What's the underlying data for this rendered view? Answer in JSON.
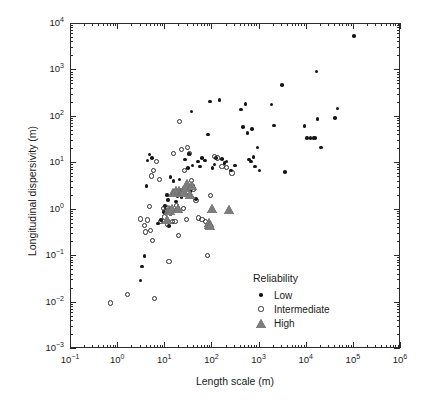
{
  "chart_data": {
    "type": "scatter",
    "title": "",
    "xlabel": "Length scale (m)",
    "ylabel": "Longitudinal dispersivity (m)",
    "xscale": "log",
    "yscale": "log",
    "xlim": [
      0.1,
      1000000
    ],
    "ylim": [
      0.001,
      10000
    ],
    "grid": false,
    "xticks": [
      0.1,
      1,
      10,
      100,
      1000,
      10000,
      100000,
      1000000
    ],
    "xtick_labels": [
      "10-1",
      "100",
      "101",
      "102",
      "103",
      "104",
      "105",
      "106"
    ],
    "yticks": [
      0.001,
      0.01,
      0.1,
      1,
      10,
      100,
      1000,
      10000
    ],
    "ytick_labels": [
      "10-3",
      "10-2",
      "10-1",
      "100",
      "101",
      "102",
      "103",
      "104"
    ],
    "legend": {
      "title": "Reliability",
      "position": "lower-right",
      "entries": [
        {
          "name": "Low",
          "marker": "filled-circle",
          "color": "#151515"
        },
        {
          "name": "Intermediate",
          "marker": "open-circle",
          "color": "#2b2b2b"
        },
        {
          "name": "High",
          "marker": "filled-triangle",
          "color": "#7d7d7d"
        }
      ]
    },
    "series": [
      {
        "name": "Low",
        "marker": "filled-circle",
        "color": "#151515",
        "points": [
          [
            3.0,
            0.03
          ],
          [
            3.2,
            0.06
          ],
          [
            3.6,
            0.1
          ],
          [
            4.0,
            3.2
          ],
          [
            4.2,
            11.5
          ],
          [
            4.6,
            15.5
          ],
          [
            5.2,
            13.0
          ],
          [
            7.0,
            0.5
          ],
          [
            8.0,
            0.6
          ],
          [
            9.5,
            0.9
          ],
          [
            10.0,
            1.2
          ],
          [
            11.0,
            2.1
          ],
          [
            11.5,
            1.6
          ],
          [
            12.0,
            0.45
          ],
          [
            13.0,
            5.0
          ],
          [
            14.0,
            0.85
          ],
          [
            15.0,
            4.1
          ],
          [
            16.0,
            2.6
          ],
          [
            17.0,
            1.5
          ],
          [
            18.0,
            2.0
          ],
          [
            19.0,
            1.1
          ],
          [
            20.0,
            4.5
          ],
          [
            22.0,
            1.9
          ],
          [
            24.0,
            2.4
          ],
          [
            26.0,
            12.0
          ],
          [
            28.0,
            2.8
          ],
          [
            30.0,
            8.0
          ],
          [
            32.0,
            16.0
          ],
          [
            34.0,
            2.5
          ],
          [
            36.0,
            130.0
          ],
          [
            38.0,
            9.0
          ],
          [
            40.0,
            3.3
          ],
          [
            45.0,
            1.7
          ],
          [
            50.0,
            11.0
          ],
          [
            55.0,
            8.5
          ],
          [
            60.0,
            13.0
          ],
          [
            70.0,
            11.5
          ],
          [
            80.0,
            42.0
          ],
          [
            90.0,
            215.0
          ],
          [
            100.0,
            8.0
          ],
          [
            110.0,
            9.5
          ],
          [
            120.0,
            13.0
          ],
          [
            140.0,
            230.0
          ],
          [
            160.0,
            12.5
          ],
          [
            180.0,
            10.0
          ],
          [
            200.0,
            11.0
          ],
          [
            250.0,
            7.0
          ],
          [
            300.0,
            9.0
          ],
          [
            400.0,
            145.0
          ],
          [
            450.0,
            60.0
          ],
          [
            500.0,
            190.0
          ],
          [
            550.0,
            45.0
          ],
          [
            600.0,
            12.0
          ],
          [
            650.0,
            11.0
          ],
          [
            700.0,
            55.0
          ],
          [
            750.0,
            13.5
          ],
          [
            800.0,
            8.5
          ],
          [
            900.0,
            22.0
          ],
          [
            1000.0,
            7.0
          ],
          [
            1800.0,
            185.0
          ],
          [
            2000.0,
            65.0
          ],
          [
            3000.0,
            480.0
          ],
          [
            3500.0,
            6.5
          ],
          [
            9000.0,
            63.0
          ],
          [
            10000.0,
            35.0
          ],
          [
            12000.0,
            35.0
          ],
          [
            14000.0,
            35.0
          ],
          [
            15000.0,
            35.0
          ],
          [
            16000.0,
            950.0
          ],
          [
            17000.0,
            90.0
          ],
          [
            20000.0,
            22.0
          ],
          [
            40000.0,
            95.0
          ],
          [
            45000.0,
            150.0
          ],
          [
            100000.0,
            5500.0
          ]
        ]
      },
      {
        "name": "Intermediate",
        "marker": "open-circle",
        "color": "#2b2b2b",
        "points": [
          [
            0.7,
            0.0098
          ],
          [
            1.6,
            0.015
          ],
          [
            3.0,
            0.63
          ],
          [
            3.6,
            0.45
          ],
          [
            3.8,
            0.33
          ],
          [
            4.2,
            0.6
          ],
          [
            4.6,
            1.15
          ],
          [
            4.8,
            0.36
          ],
          [
            5.2,
            5.3
          ],
          [
            5.4,
            0.22
          ],
          [
            5.6,
            7.0
          ],
          [
            6.0,
            0.012
          ],
          [
            6.5,
            11.0
          ],
          [
            7.5,
            4.5
          ],
          [
            8.0,
            0.55
          ],
          [
            9.0,
            1.05
          ],
          [
            9.5,
            0.7
          ],
          [
            10.0,
            0.95
          ],
          [
            10.5,
            1.1
          ],
          [
            11.0,
            0.48
          ],
          [
            12.0,
            0.078
          ],
          [
            13.0,
            0.82
          ],
          [
            14.0,
            0.55
          ],
          [
            15.0,
            16.0
          ],
          [
            16.0,
            0.56
          ],
          [
            17.0,
            1.25
          ],
          [
            18.0,
            1.0
          ],
          [
            19.0,
            0.28
          ],
          [
            20.0,
            80.0
          ],
          [
            22.0,
            20.0
          ],
          [
            24.0,
            1.05
          ],
          [
            26.0,
            7.0
          ],
          [
            28.0,
            0.62
          ],
          [
            30.0,
            22.0
          ],
          [
            33.0,
            16.5
          ],
          [
            36.0,
            4.3
          ],
          [
            40.0,
            2.8
          ],
          [
            45.0,
            1.6
          ],
          [
            50.0,
            0.66
          ],
          [
            60.0,
            0.62
          ],
          [
            70.0,
            0.56
          ],
          [
            80.0,
            0.105
          ],
          [
            90.0,
            2.0
          ],
          [
            110.0,
            14.0
          ],
          [
            130.0,
            13.0
          ],
          [
            160.0,
            8.5
          ],
          [
            200.0,
            8.0
          ],
          [
            260.0,
            6.2
          ]
        ]
      },
      {
        "name": "High",
        "marker": "filled-triangle",
        "color": "#7d7d7d",
        "points": [
          [
            11.0,
            0.62
          ],
          [
            12.0,
            1.0
          ],
          [
            13.0,
            0.95
          ],
          [
            14.0,
            1.05
          ],
          [
            15.0,
            2.3
          ],
          [
            17.0,
            2.5
          ],
          [
            19.0,
            1.05
          ],
          [
            20.0,
            2.6
          ],
          [
            22.0,
            2.3
          ],
          [
            24.0,
            2.6
          ],
          [
            26.0,
            2.4
          ],
          [
            28.0,
            2.9
          ],
          [
            30.0,
            3.6
          ],
          [
            34.0,
            2.1
          ],
          [
            38.0,
            3.3
          ],
          [
            85.0,
            0.47
          ],
          [
            88.0,
            0.52
          ],
          [
            90.0,
            0.44
          ],
          [
            100.0,
            1.05
          ],
          [
            230.0,
            1.0
          ]
        ]
      }
    ]
  }
}
